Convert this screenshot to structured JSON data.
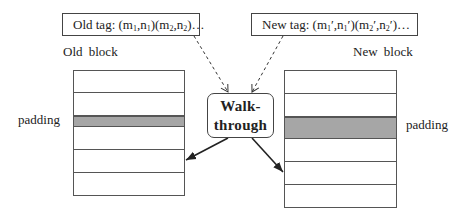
{
  "old_tag": {
    "prefix": "Old tag: ",
    "parts": [
      "(m",
      "1",
      ",n",
      "1",
      ")(m",
      "2",
      ",n",
      "2",
      ")…"
    ]
  },
  "new_tag": {
    "prefix": "New tag: ",
    "parts": [
      "(m",
      "1",
      "′,n",
      "1",
      "′)(m",
      "2",
      "′,n",
      "2",
      "′)…"
    ]
  },
  "old_block": {
    "label": "Old block",
    "padding_label": "padding",
    "rows": [
      {
        "height": 22,
        "padding": false
      },
      {
        "height": 23,
        "padding": false
      },
      {
        "height": 11,
        "padding": true
      },
      {
        "height": 23,
        "padding": false
      },
      {
        "height": 23,
        "padding": false
      },
      {
        "height": 23,
        "padding": false
      }
    ]
  },
  "new_block": {
    "label": "New block",
    "padding_label": "padding",
    "rows": [
      {
        "height": 23,
        "padding": false
      },
      {
        "height": 23,
        "padding": false
      },
      {
        "height": 22,
        "padding": true
      },
      {
        "height": 23,
        "padding": false
      },
      {
        "height": 23,
        "padding": false
      },
      {
        "height": 23,
        "padding": false
      }
    ]
  },
  "walkthrough": {
    "line1": "Walk-",
    "line2": "through"
  },
  "colors": {
    "padding_fill": "#a6a6a6",
    "stroke": "#444444",
    "arrow": "#222222"
  }
}
